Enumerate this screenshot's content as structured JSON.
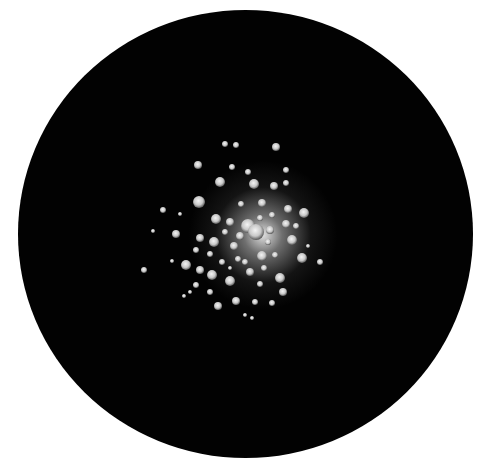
{
  "image": {
    "description": "Drawing of a globular star cluster inside a black circular field of view on white background",
    "top_text_fragment": "",
    "colors": {
      "background": "#ffffff",
      "field": "#020202",
      "stars": "#d8d8d8",
      "core": "#f0f0f0"
    }
  },
  "field": {
    "cx": 245,
    "cy": 232,
    "r": 228
  },
  "stars": [
    [
      225,
      144,
      3
    ],
    [
      236,
      145,
      3
    ],
    [
      276,
      147,
      4
    ],
    [
      198,
      165,
      4
    ],
    [
      232,
      167,
      3
    ],
    [
      248,
      172,
      3
    ],
    [
      286,
      170,
      3
    ],
    [
      220,
      182,
      5
    ],
    [
      254,
      184,
      5
    ],
    [
      274,
      186,
      4
    ],
    [
      286,
      183,
      3
    ],
    [
      199,
      202,
      6
    ],
    [
      163,
      210,
      3
    ],
    [
      180,
      214,
      2
    ],
    [
      304,
      213,
      5
    ],
    [
      288,
      209,
      4
    ],
    [
      262,
      203,
      4
    ],
    [
      241,
      204,
      3
    ],
    [
      216,
      219,
      5
    ],
    [
      230,
      222,
      4
    ],
    [
      248,
      226,
      7
    ],
    [
      256,
      232,
      8
    ],
    [
      270,
      230,
      4
    ],
    [
      286,
      224,
      4
    ],
    [
      292,
      240,
      5
    ],
    [
      153,
      231,
      2
    ],
    [
      176,
      234,
      4
    ],
    [
      200,
      238,
      4
    ],
    [
      214,
      242,
      5
    ],
    [
      234,
      246,
      4
    ],
    [
      262,
      256,
      5
    ],
    [
      275,
      255,
      3
    ],
    [
      302,
      258,
      5
    ],
    [
      320,
      262,
      3
    ],
    [
      144,
      270,
      3
    ],
    [
      172,
      261,
      2
    ],
    [
      186,
      265,
      5
    ],
    [
      200,
      270,
      4
    ],
    [
      212,
      275,
      5
    ],
    [
      230,
      281,
      5
    ],
    [
      250,
      272,
      4
    ],
    [
      260,
      284,
      3
    ],
    [
      280,
      278,
      5
    ],
    [
      283,
      292,
      4
    ],
    [
      196,
      285,
      3
    ],
    [
      218,
      306,
      4
    ],
    [
      236,
      301,
      4
    ],
    [
      255,
      302,
      3
    ],
    [
      272,
      303,
      3
    ],
    [
      190,
      292,
      2
    ],
    [
      210,
      292,
      3
    ],
    [
      245,
      315,
      2
    ],
    [
      252,
      318,
      2
    ],
    [
      184,
      296,
      2
    ],
    [
      296,
      226,
      3
    ],
    [
      308,
      246,
      2
    ],
    [
      238,
      259,
      3
    ],
    [
      245,
      262,
      3
    ],
    [
      222,
      262,
      3
    ],
    [
      264,
      268,
      3
    ],
    [
      230,
      268,
      2
    ],
    [
      210,
      254,
      3
    ],
    [
      196,
      250,
      3
    ],
    [
      272,
      215,
      3
    ],
    [
      260,
      218,
      3
    ],
    [
      225,
      232,
      3
    ],
    [
      240,
      236,
      4
    ],
    [
      268,
      242,
      3
    ]
  ]
}
